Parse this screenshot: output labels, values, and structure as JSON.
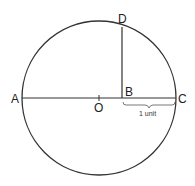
{
  "diagram": {
    "points": {
      "A": "A",
      "O": "O",
      "B": "B",
      "C": "C",
      "D": "D"
    },
    "annotation": "1 unit",
    "stroke_color": "#333333"
  }
}
